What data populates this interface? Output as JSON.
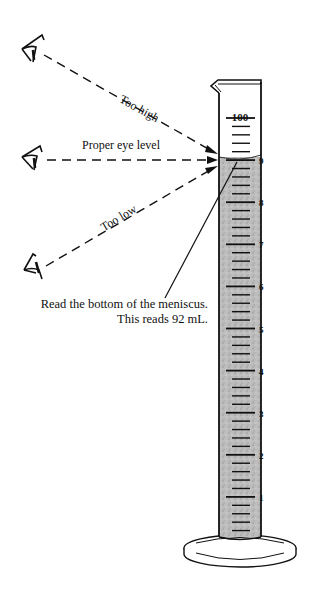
{
  "diagram": {
    "sight_lines": [
      {
        "label": "Too high",
        "eye_y": 50,
        "target_y": 155
      },
      {
        "label": "Proper eye level",
        "eye_y": 160,
        "target_y": 160
      },
      {
        "label": "Too low",
        "eye_y": 268,
        "target_y": 166
      }
    ],
    "cylinder": {
      "top_label": "100",
      "scale_labels": [
        "9",
        "8",
        "7",
        "6",
        "5",
        "4",
        "3",
        "2",
        "1"
      ],
      "liquid_reading_ml": 92,
      "units": "mL"
    },
    "caption": {
      "line1": "Read the bottom of the meniscus.",
      "line2": "This reads 92 mL."
    },
    "colors": {
      "ink": "#111111",
      "liquid": "#b9b9b9",
      "background": "#ffffff"
    }
  }
}
